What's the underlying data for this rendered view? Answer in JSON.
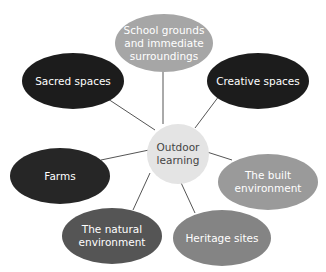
{
  "diagram": {
    "type": "mind-map",
    "center": {
      "label": "Outdoor learning",
      "line1": "Outdoor",
      "line2": "learning",
      "color": "#e4e4e4",
      "text_color": "#444444"
    },
    "nodes": [
      {
        "id": "school",
        "line1": "School grounds",
        "line2": "and immediate",
        "line3": "surroundings",
        "color": "#a6a6a6"
      },
      {
        "id": "sacred",
        "line1": "Sacred spaces",
        "color": "#1c1c1c"
      },
      {
        "id": "creative",
        "line1": "Creative spaces",
        "color": "#1c1c1c"
      },
      {
        "id": "farms",
        "line1": "Farms",
        "color": "#262626"
      },
      {
        "id": "built",
        "line1": "The built",
        "line2": "environment",
        "color": "#9a9a9a"
      },
      {
        "id": "natural",
        "line1": "The natural",
        "line2": "environment",
        "color": "#555555"
      },
      {
        "id": "heritage",
        "line1": "Heritage sites",
        "color": "#848484"
      }
    ],
    "connector_color": "#555555"
  }
}
